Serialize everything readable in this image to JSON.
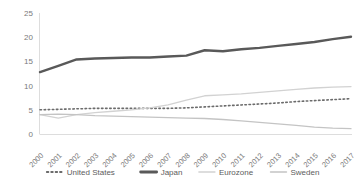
{
  "chart_data": {
    "type": "line",
    "title": "",
    "subtitle": "",
    "xlabel": "",
    "ylabel": "",
    "grid": false,
    "legend_position": "bottom",
    "xlim": [
      2000,
      2017
    ],
    "ylim": [
      0,
      25
    ],
    "yticks": [
      0,
      5,
      10,
      15,
      20,
      25
    ],
    "ytick_labels": [
      "0",
      "5",
      "10",
      "15",
      "20",
      "25"
    ],
    "categories": [
      "2000",
      "2001",
      "2002",
      "2003",
      "2004",
      "2005",
      "2006",
      "2007",
      "2008",
      "2009",
      "2010",
      "2011",
      "2012",
      "2013",
      "2014",
      "2015",
      "2016",
      "2017"
    ],
    "series": [
      {
        "name": "United States",
        "color": "#6b6b6b",
        "style": "dotted",
        "width": 1.6,
        "values": [
          5.0,
          5.1,
          5.2,
          5.3,
          5.3,
          5.3,
          5.3,
          5.3,
          5.4,
          5.6,
          5.8,
          6.0,
          6.2,
          6.4,
          6.7,
          6.9,
          7.1,
          7.3
        ]
      },
      {
        "name": "Japan",
        "color": "#595959",
        "style": "solid",
        "width": 2.4,
        "values": [
          12.8,
          14.1,
          15.4,
          15.6,
          15.7,
          15.8,
          15.8,
          16.0,
          16.2,
          17.3,
          17.1,
          17.5,
          17.8,
          18.2,
          18.6,
          19.0,
          19.6,
          20.1
        ]
      },
      {
        "name": "Eurozone",
        "color": "#d2d2d2",
        "style": "solid",
        "width": 1.3,
        "values": [
          4.0,
          3.3,
          4.0,
          4.4,
          4.7,
          5.0,
          5.4,
          6.0,
          7.0,
          7.9,
          8.1,
          8.3,
          8.6,
          8.9,
          9.2,
          9.5,
          9.7,
          9.8
        ]
      },
      {
        "name": "Sweden",
        "color": "#c4c4c4",
        "style": "solid",
        "width": 1.3,
        "values": [
          4.0,
          4.1,
          4.0,
          3.8,
          3.7,
          3.6,
          3.5,
          3.4,
          3.3,
          3.2,
          3.0,
          2.7,
          2.4,
          2.1,
          1.8,
          1.4,
          1.2,
          1.1
        ]
      }
    ],
    "legend_entries": [
      {
        "label": "United States",
        "color": "#6b6b6b",
        "style": "dotted",
        "width": 1.8
      },
      {
        "label": "Japan",
        "color": "#595959",
        "style": "solid",
        "width": 2.8
      },
      {
        "label": "Eurozone",
        "color": "#d2d2d2",
        "style": "solid",
        "width": 1.4
      },
      {
        "label": "Sweden",
        "color": "#c4c4c4",
        "style": "solid",
        "width": 1.4
      }
    ]
  }
}
